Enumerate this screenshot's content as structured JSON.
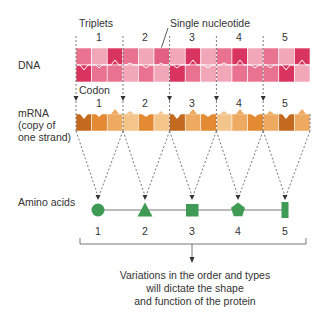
{
  "labels": {
    "triplets": "Triplets",
    "single_nucleotide": "Single nucleotide",
    "dna": "DNA",
    "codon": "Codon",
    "mrna_line1": "mRNA",
    "mrna_line2": "(copy of",
    "mrna_line3": "one strand)",
    "amino_acids": "Amino acids"
  },
  "triplet_numbers": [
    "1",
    "2",
    "3",
    "4",
    "5"
  ],
  "codon_numbers": [
    "1",
    "2",
    "3",
    "4",
    "5"
  ],
  "amino_acid_numbers": [
    "1",
    "2",
    "3",
    "4",
    "5"
  ],
  "amino_acid_shapes": [
    "circle",
    "triangle",
    "square",
    "pentagon",
    "rectangle"
  ],
  "caption": {
    "line1": "Variations in the order and types",
    "line2": "will dictate the shape",
    "line3": "and function of the protein"
  },
  "colors": {
    "dna_dark": "#d9345f",
    "dna_mid": "#e8728f",
    "dna_light": "#f2a7b8",
    "mrna_dark": "#c46a1e",
    "mrna_mid": "#e38a32",
    "mrna_light": "#efaa62",
    "mrna_pale": "#f4c58a",
    "amino_green": "#3f9a55",
    "line": "#555555"
  }
}
